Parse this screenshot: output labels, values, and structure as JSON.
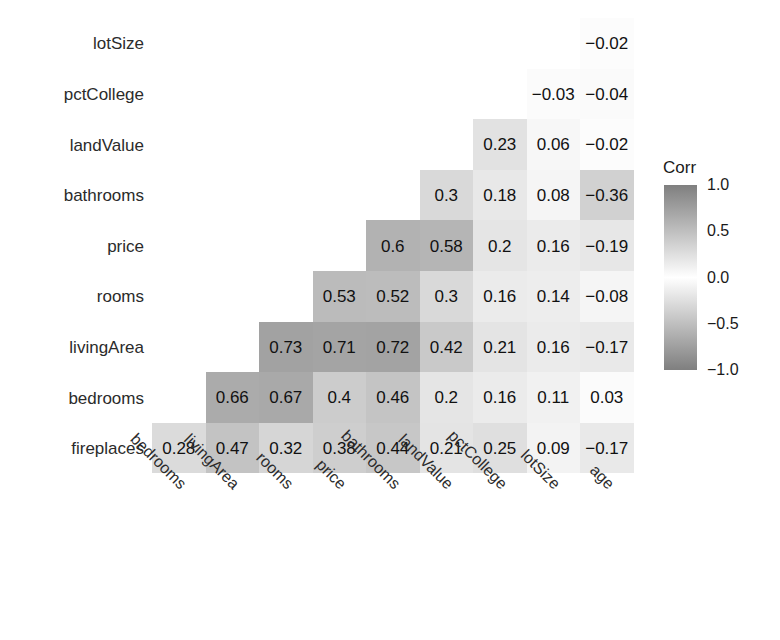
{
  "chart_data": {
    "type": "heatmap",
    "title": "",
    "subtitle": "",
    "xlabel": "",
    "ylabel": "",
    "grid": false,
    "shape": "lower-triangle correlation matrix",
    "x_categories": [
      "bedrooms",
      "livingArea",
      "rooms",
      "price",
      "bathrooms",
      "landValue",
      "pctCollege",
      "lotSize",
      "age"
    ],
    "y_categories": [
      "lotSize",
      "pctCollege",
      "landValue",
      "bathrooms",
      "price",
      "rooms",
      "livingArea",
      "bedrooms",
      "fireplaces"
    ],
    "value_range": [
      -1.0,
      1.0
    ],
    "rows": [
      {
        "label": "lotSize",
        "cells": [
          {
            "x": "bedrooms",
            "value": null,
            "text": ""
          },
          {
            "x": "livingArea",
            "value": null,
            "text": ""
          },
          {
            "x": "rooms",
            "value": null,
            "text": ""
          },
          {
            "x": "price",
            "value": null,
            "text": ""
          },
          {
            "x": "bathrooms",
            "value": null,
            "text": ""
          },
          {
            "x": "landValue",
            "value": null,
            "text": ""
          },
          {
            "x": "pctCollege",
            "value": null,
            "text": ""
          },
          {
            "x": "lotSize",
            "value": null,
            "text": ""
          },
          {
            "x": "age",
            "value": -0.02,
            "text": "−0.02"
          }
        ]
      },
      {
        "label": "pctCollege",
        "cells": [
          {
            "x": "bedrooms",
            "value": null,
            "text": ""
          },
          {
            "x": "livingArea",
            "value": null,
            "text": ""
          },
          {
            "x": "rooms",
            "value": null,
            "text": ""
          },
          {
            "x": "price",
            "value": null,
            "text": ""
          },
          {
            "x": "bathrooms",
            "value": null,
            "text": ""
          },
          {
            "x": "landValue",
            "value": null,
            "text": ""
          },
          {
            "x": "pctCollege",
            "value": null,
            "text": ""
          },
          {
            "x": "lotSize",
            "value": -0.03,
            "text": "−0.03"
          },
          {
            "x": "age",
            "value": -0.04,
            "text": "−0.04"
          }
        ]
      },
      {
        "label": "landValue",
        "cells": [
          {
            "x": "bedrooms",
            "value": null,
            "text": ""
          },
          {
            "x": "livingArea",
            "value": null,
            "text": ""
          },
          {
            "x": "rooms",
            "value": null,
            "text": ""
          },
          {
            "x": "price",
            "value": null,
            "text": ""
          },
          {
            "x": "bathrooms",
            "value": null,
            "text": ""
          },
          {
            "x": "landValue",
            "value": null,
            "text": ""
          },
          {
            "x": "pctCollege",
            "value": 0.23,
            "text": "0.23"
          },
          {
            "x": "lotSize",
            "value": 0.06,
            "text": "0.06"
          },
          {
            "x": "age",
            "value": -0.02,
            "text": "−0.02"
          }
        ]
      },
      {
        "label": "bathrooms",
        "cells": [
          {
            "x": "bedrooms",
            "value": null,
            "text": ""
          },
          {
            "x": "livingArea",
            "value": null,
            "text": ""
          },
          {
            "x": "rooms",
            "value": null,
            "text": ""
          },
          {
            "x": "price",
            "value": null,
            "text": ""
          },
          {
            "x": "bathrooms",
            "value": null,
            "text": ""
          },
          {
            "x": "landValue",
            "value": 0.3,
            "text": "0.3"
          },
          {
            "x": "pctCollege",
            "value": 0.18,
            "text": "0.18"
          },
          {
            "x": "lotSize",
            "value": 0.08,
            "text": "0.08"
          },
          {
            "x": "age",
            "value": -0.36,
            "text": "−0.36"
          }
        ]
      },
      {
        "label": "price",
        "cells": [
          {
            "x": "bedrooms",
            "value": null,
            "text": ""
          },
          {
            "x": "livingArea",
            "value": null,
            "text": ""
          },
          {
            "x": "rooms",
            "value": null,
            "text": ""
          },
          {
            "x": "price",
            "value": null,
            "text": ""
          },
          {
            "x": "bathrooms",
            "value": 0.6,
            "text": "0.6"
          },
          {
            "x": "landValue",
            "value": 0.58,
            "text": "0.58"
          },
          {
            "x": "pctCollege",
            "value": 0.2,
            "text": "0.2"
          },
          {
            "x": "lotSize",
            "value": 0.16,
            "text": "0.16"
          },
          {
            "x": "age",
            "value": -0.19,
            "text": "−0.19"
          }
        ]
      },
      {
        "label": "rooms",
        "cells": [
          {
            "x": "bedrooms",
            "value": null,
            "text": ""
          },
          {
            "x": "livingArea",
            "value": null,
            "text": ""
          },
          {
            "x": "rooms",
            "value": null,
            "text": ""
          },
          {
            "x": "price",
            "value": 0.53,
            "text": "0.53"
          },
          {
            "x": "bathrooms",
            "value": 0.52,
            "text": "0.52"
          },
          {
            "x": "landValue",
            "value": 0.3,
            "text": "0.3"
          },
          {
            "x": "pctCollege",
            "value": 0.16,
            "text": "0.16"
          },
          {
            "x": "lotSize",
            "value": 0.14,
            "text": "0.14"
          },
          {
            "x": "age",
            "value": -0.08,
            "text": "−0.08"
          }
        ]
      },
      {
        "label": "livingArea",
        "cells": [
          {
            "x": "bedrooms",
            "value": null,
            "text": ""
          },
          {
            "x": "livingArea",
            "value": null,
            "text": ""
          },
          {
            "x": "rooms",
            "value": 0.73,
            "text": "0.73"
          },
          {
            "x": "price",
            "value": 0.71,
            "text": "0.71"
          },
          {
            "x": "bathrooms",
            "value": 0.72,
            "text": "0.72"
          },
          {
            "x": "landValue",
            "value": 0.42,
            "text": "0.42"
          },
          {
            "x": "pctCollege",
            "value": 0.21,
            "text": "0.21"
          },
          {
            "x": "lotSize",
            "value": 0.16,
            "text": "0.16"
          },
          {
            "x": "age",
            "value": -0.17,
            "text": "−0.17"
          }
        ]
      },
      {
        "label": "bedrooms",
        "cells": [
          {
            "x": "bedrooms",
            "value": null,
            "text": ""
          },
          {
            "x": "livingArea",
            "value": 0.66,
            "text": "0.66"
          },
          {
            "x": "rooms",
            "value": 0.67,
            "text": "0.67"
          },
          {
            "x": "price",
            "value": 0.4,
            "text": "0.4"
          },
          {
            "x": "bathrooms",
            "value": 0.46,
            "text": "0.46"
          },
          {
            "x": "landValue",
            "value": 0.2,
            "text": "0.2"
          },
          {
            "x": "pctCollege",
            "value": 0.16,
            "text": "0.16"
          },
          {
            "x": "lotSize",
            "value": 0.11,
            "text": "0.11"
          },
          {
            "x": "age",
            "value": 0.03,
            "text": "0.03"
          }
        ]
      },
      {
        "label": "fireplaces",
        "cells": [
          {
            "x": "bedrooms",
            "value": 0.28,
            "text": "0.28"
          },
          {
            "x": "livingArea",
            "value": 0.47,
            "text": "0.47"
          },
          {
            "x": "rooms",
            "value": 0.32,
            "text": "0.32"
          },
          {
            "x": "price",
            "value": 0.38,
            "text": "0.38"
          },
          {
            "x": "bathrooms",
            "value": 0.44,
            "text": "0.44"
          },
          {
            "x": "landValue",
            "value": 0.21,
            "text": "0.21"
          },
          {
            "x": "pctCollege",
            "value": 0.25,
            "text": "0.25"
          },
          {
            "x": "lotSize",
            "value": 0.09,
            "text": "0.09"
          },
          {
            "x": "age",
            "value": -0.17,
            "text": "−0.17"
          }
        ]
      }
    ],
    "legend": {
      "title": "Corr",
      "position": "right",
      "ticks": [
        "1.0",
        "0.5",
        "0.0",
        "−0.5",
        "−1.0"
      ],
      "tick_values": [
        1.0,
        0.5,
        0.0,
        -0.5,
        -1.0
      ],
      "colors": {
        "max_positive": "#7f7f7f",
        "mid_zero": "#ffffff",
        "max_negative": "#7f7f7f",
        "text": "#1a1a1a"
      }
    }
  }
}
